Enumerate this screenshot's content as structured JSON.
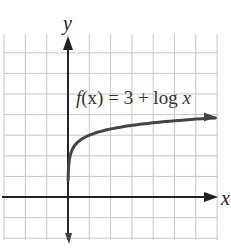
{
  "chart_data": {
    "type": "line",
    "title": "",
    "function_label": "f(x) = 3 + log x",
    "function_parts": {
      "f": "f",
      "arg": "(x)",
      "rest": " = 3 + log ",
      "var": "x"
    },
    "xlabel": "x",
    "ylabel": "y",
    "xlim": [
      -3,
      7
    ],
    "ylim": [
      -2,
      8
    ],
    "grid": true,
    "series": [
      {
        "name": "f(x) = 3 + log x",
        "x": [
          0.01,
          0.05,
          0.1,
          0.2,
          0.5,
          1,
          2,
          3,
          4,
          5,
          6,
          7
        ],
        "y": [
          1,
          1.7,
          2,
          2.3,
          2.7,
          3,
          3.3,
          3.48,
          3.6,
          3.7,
          3.78,
          3.85
        ]
      }
    ],
    "colors": {
      "grid": "#c8c8c8",
      "axis": "#222222",
      "curve": "#444444"
    }
  }
}
